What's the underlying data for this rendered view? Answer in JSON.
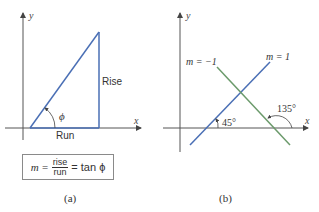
{
  "panels": {
    "a": {
      "caption": "(a)",
      "axis_x_label": "x",
      "axis_y_label": "y",
      "rise_label": "Rise",
      "run_label": "Run",
      "angle_label": "ϕ",
      "formula": {
        "lhs": "m =",
        "numerator": "rise",
        "denominator": "run",
        "rhs": "= tan ϕ"
      },
      "line_color": "#4a6fb5"
    },
    "b": {
      "caption": "(b)",
      "axis_x_label": "x",
      "axis_y_label": "y",
      "line_pos_label": "m = 1",
      "line_neg_label": "m = −1",
      "angle_pos_label": "45°",
      "angle_neg_label": "135°",
      "line_pos_color": "#4a6fb5",
      "line_neg_color": "#6b9a6b"
    }
  }
}
